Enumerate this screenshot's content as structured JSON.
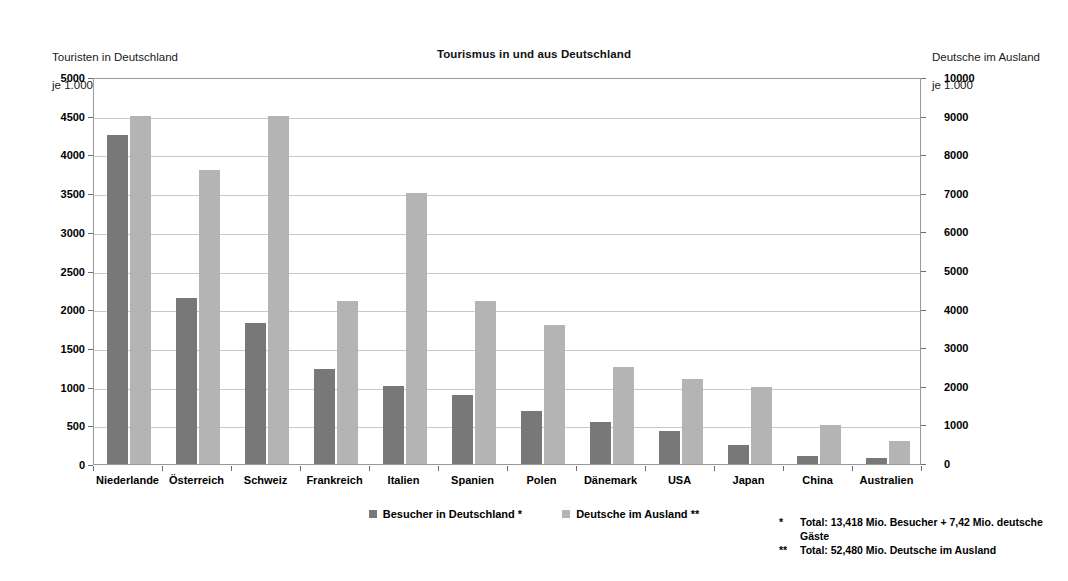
{
  "chart_data": {
    "type": "bar",
    "title": "Tourismus in und aus Deutschland",
    "xlabel": "",
    "ylabel": "Touristen in Deutschland\nje 1.000",
    "y2label": "Deutsche im Ausland\nje 1.000",
    "grid": true,
    "legend_position": "bottom-center",
    "ylim": [
      0,
      5000
    ],
    "y2lim": [
      0,
      10000
    ],
    "yticks": [
      0,
      500,
      1000,
      1500,
      2000,
      2500,
      3000,
      3500,
      4000,
      4500,
      5000
    ],
    "y2ticks": [
      0,
      1000,
      2000,
      3000,
      4000,
      5000,
      6000,
      7000,
      8000,
      9000,
      10000
    ],
    "categories": [
      "Niederlande",
      "Österreich",
      "Schweiz",
      "Frankreich",
      "Italien",
      "Spanien",
      "Polen",
      "Dänemark",
      "USA",
      "Japan",
      "China",
      "Australien"
    ],
    "series": [
      {
        "name": "Besucher in Deutschland  *",
        "axis": "left",
        "color": "#787878",
        "values": [
          4250,
          2140,
          1820,
          1230,
          1010,
          890,
          680,
          540,
          430,
          240,
          110,
          80
        ]
      },
      {
        "name": "Deutsche im Ausland **",
        "axis": "left",
        "color": "#b4b4b4",
        "values": [
          4500,
          3800,
          4500,
          2100,
          3500,
          2100,
          1800,
          1250,
          1100,
          1000,
          500,
          300
        ]
      }
    ],
    "annotations": [
      "*  Total: 13,418 Mio. Besucher + 7,42 Mio. deutsche Gäste",
      "** Total: 52,480 Mio. Deutsche im Ausland"
    ]
  },
  "axis_captions": {
    "left_line1": "Touristen in Deutschland",
    "left_line2": "je 1.000",
    "right_line1": "Deutsche im Ausland",
    "right_line2": "je 1.000"
  },
  "legend": {
    "items": [
      {
        "label": "Besucher in Deutschland  *",
        "swatch": "series-0"
      },
      {
        "label": "Deutsche im Ausland **",
        "swatch": "series-1"
      }
    ]
  },
  "footnotes": [
    {
      "marker": "*",
      "text": "Total: 13,418 Mio. Besucher + 7,42 Mio. deutsche Gäste"
    },
    {
      "marker": "**",
      "text": "Total: 52,480 Mio. Deutsche im Ausland"
    }
  ],
  "colors": {
    "series_dark": "#787878",
    "series_light": "#b4b4b4",
    "gridline": "#c8c8c8",
    "axis": "#9a9a9a"
  }
}
